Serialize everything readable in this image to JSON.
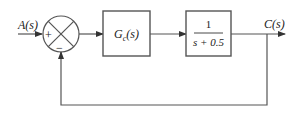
{
  "diagram": {
    "type": "block-diagram",
    "input": {
      "label": "A(s)"
    },
    "output": {
      "label": "C(s)"
    },
    "summing_junction": {
      "signs": {
        "left": "+",
        "bottom": "−"
      }
    },
    "blocks": [
      {
        "id": "controller",
        "label_main": "G",
        "label_sub": "c",
        "label_arg": "(s)"
      },
      {
        "id": "plant",
        "numerator": "1",
        "denominator": "s + 0.5"
      }
    ],
    "feedback": {
      "type": "unity",
      "sign": "negative"
    },
    "colors": {
      "line": "#555555",
      "text": "#222222",
      "background": "#ffffff"
    }
  }
}
